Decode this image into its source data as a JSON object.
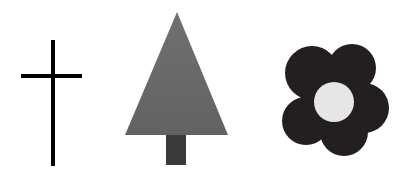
{
  "figure": {
    "background": "#ffffff",
    "shapes": [
      {
        "name": "cross",
        "color": "#000000",
        "vertical": {
          "x": 53,
          "y1": 40,
          "y2": 166,
          "width": 4
        },
        "horizontal": {
          "y": 76,
          "x1": 21,
          "x2": 82,
          "width": 4
        }
      },
      {
        "name": "tree",
        "foliage_color": "#6a6a6a",
        "trunk_color": "#3a3a3a",
        "triangle": {
          "apex": [
            177,
            12
          ],
          "base_left": [
            125,
            135
          ],
          "base_right": [
            228,
            135
          ]
        },
        "trunk": {
          "x": 166,
          "y": 135,
          "width": 20,
          "height": 30
        }
      },
      {
        "name": "flower",
        "petal_color": "#231f20",
        "center_color": "#e6e6e6",
        "center": [
          334,
          102
        ],
        "center_radius": 20,
        "petal_radius": 27
      }
    ]
  }
}
